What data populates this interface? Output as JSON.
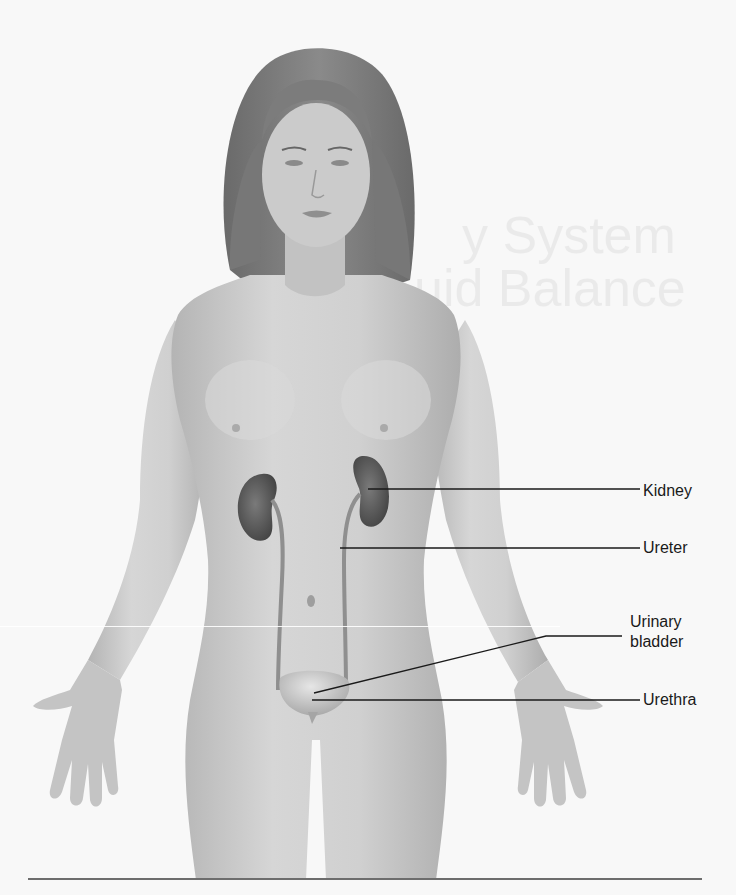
{
  "figure": {
    "background_color": "#f8f8f8",
    "ghost_text": [
      "y System",
      "uid Balance"
    ]
  },
  "labels": [
    {
      "id": "kidney",
      "text": "Kidney",
      "x": 643,
      "y": 481,
      "line": {
        "x1": 368,
        "y1": 489,
        "x2": 640,
        "y2": 489
      }
    },
    {
      "id": "ureter",
      "text": "Ureter",
      "x": 643,
      "y": 538,
      "line": {
        "x1": 340,
        "y1": 548,
        "x2": 640,
        "y2": 548
      }
    },
    {
      "id": "urinary-bladder",
      "text": "Urinary\nbladder",
      "x": 630,
      "y": 612,
      "line_points": "314,693 546,636 622,636"
    },
    {
      "id": "urethra",
      "text": "Urethra",
      "x": 643,
      "y": 690,
      "line": {
        "x1": 312,
        "y1": 700,
        "x2": 640,
        "y2": 700
      }
    }
  ],
  "colors": {
    "skin": "#c9c9c9",
    "skin_shadow": "#a8a8a8",
    "hair": "#7a7a7a",
    "organ": "#5c5c5c",
    "leader_line": "#1a1a1a",
    "rule": "#6d6d6d"
  }
}
